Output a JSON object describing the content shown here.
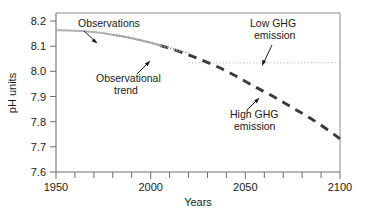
{
  "chart_data": {
    "type": "line",
    "title": "",
    "xlabel": "Years",
    "ylabel": "pH units",
    "xlim": [
      1950,
      2100
    ],
    "ylim": [
      7.6,
      8.2
    ],
    "grid": false,
    "legend_position": "none",
    "x_ticks_major": [
      1950,
      2000,
      2050,
      2100
    ],
    "x_tick_labels": [
      "1950",
      "2000",
      "2050",
      "2100"
    ],
    "x_tick_minor_step": 10,
    "y_ticks": [
      7.6,
      7.7,
      7.8,
      7.9,
      8.0,
      8.1,
      8.2
    ],
    "y_tick_labels": [
      "7.6",
      "7.7",
      "7.8",
      "7.9",
      "8.0",
      "8.1",
      "8.2"
    ],
    "series": [
      {
        "name": "Observational trend",
        "style": "solid-grey",
        "color": "#b0b0b0",
        "x": [
          1950,
          1960,
          1970,
          1980,
          1990,
          2000,
          2005
        ],
        "values": [
          8.135,
          8.133,
          8.128,
          8.118,
          8.105,
          8.088,
          8.078
        ]
      },
      {
        "name": "Observations",
        "style": "scatter-dotted-grey",
        "color": "#9a9a9a",
        "x": [
          1980,
          1985,
          1990,
          1995,
          2000,
          2005,
          2010,
          2015,
          2020
        ],
        "values": [
          8.118,
          8.112,
          8.105,
          8.097,
          8.088,
          8.078,
          8.068,
          8.058,
          8.048
        ]
      },
      {
        "name": "Low GHG emission",
        "style": "dotted-light-grey",
        "color": "#c6c6c6",
        "x": [
          2020,
          2030,
          2040,
          2050,
          2060,
          2070,
          2080,
          2090,
          2100
        ],
        "values": [
          8.012,
          8.012,
          8.012,
          8.012,
          8.012,
          8.012,
          8.012,
          8.013,
          8.013
        ]
      },
      {
        "name": "High GHG emission",
        "style": "thick-dashed-dark",
        "color": "#3a3a3a",
        "x": [
          2005,
          2015,
          2025,
          2035,
          2045,
          2055,
          2065,
          2075,
          2085,
          2095,
          2100
        ],
        "values": [
          8.078,
          8.055,
          8.028,
          7.998,
          7.962,
          7.922,
          7.884,
          7.842,
          7.8,
          7.752,
          7.725
        ]
      }
    ],
    "annotations": [
      {
        "id": "observations",
        "text_line1": "Observations",
        "text_line2": "",
        "points_to_x": 1972,
        "points_to_y": 8.125
      },
      {
        "id": "observational-trend",
        "text_line1": "Observational",
        "text_line2": "trend",
        "points_to_x": 2000,
        "points_to_y": 8.088
      },
      {
        "id": "low-ghg-emission",
        "text_line1": "Low GHG",
        "text_line2": "emission",
        "points_to_x": 2062,
        "points_to_y": 8.012
      },
      {
        "id": "high-ghg-emission",
        "text_line1": "High GHG",
        "text_line2": "emission",
        "points_to_x": 2060,
        "points_to_y": 7.893
      }
    ]
  },
  "axes": {
    "y_label": "pH units",
    "x_label": "Years"
  },
  "labels": {
    "y_8_2": "8.2",
    "y_8_1": "8.1",
    "y_8_0": "8.0",
    "y_7_9": "7.9",
    "y_7_8": "7.8",
    "y_7_7": "7.7",
    "y_7_6": "7.6",
    "x_1950": "1950",
    "x_2000": "2000",
    "x_2050": "2050",
    "x_2100": "2100",
    "ann_observations": "Observations",
    "ann_obs_trend_1": "Observational",
    "ann_obs_trend_2": "trend",
    "ann_low_ghg_1": "Low GHG",
    "ann_low_ghg_2": "emission",
    "ann_high_ghg_1": "High GHG",
    "ann_high_ghg_2": "emission"
  },
  "colors": {
    "frame": "#8a8a8a",
    "observational_trend": "#b0b0b0",
    "observations": "#9a9a9a",
    "low_ghg": "#c6c6c6",
    "high_ghg": "#3a3a3a",
    "text": "#1a1a1a"
  }
}
